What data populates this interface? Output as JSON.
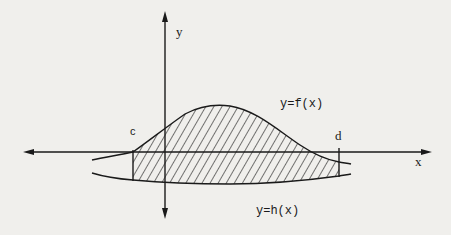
{
  "diagram": {
    "colors": {
      "background": "#f0efec",
      "ink": "#1a1a1a"
    },
    "axes": {
      "x_label": "x",
      "y_label": "y"
    },
    "curves": [
      {
        "id": "f",
        "label": "y=f(x)",
        "position": "upper"
      },
      {
        "id": "h",
        "label": "y=h(x)",
        "position": "lower"
      }
    ],
    "bounds": {
      "left_label": "c",
      "right_label": "d"
    },
    "shaded_region": {
      "description": "Region between f(x) and h(x) for c ≤ x ≤ d, filled with diagonal hatching",
      "pattern": "diagonal-hatch"
    }
  }
}
